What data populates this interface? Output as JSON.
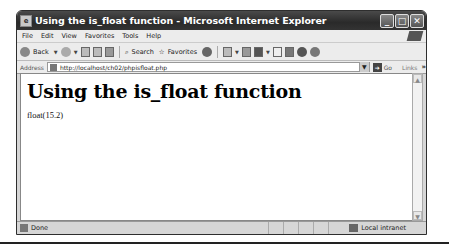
{
  "window": {
    "title": "Using the is_float function - Microsoft Internet Explorer",
    "controls": {
      "minimize": "_",
      "maximize": "□",
      "close": "✕"
    }
  },
  "menubar": {
    "items": [
      "File",
      "Edit",
      "View",
      "Favorites",
      "Tools",
      "Help"
    ]
  },
  "toolbar": {
    "back_label": "Back",
    "search_label": "Search",
    "favorites_label": "Favorites"
  },
  "addressbar": {
    "label": "Address",
    "url": "http://localhost/ch02/phpisfloat.php",
    "go_label": "Go",
    "links_label": "Links",
    "chevron": "»"
  },
  "page": {
    "heading": "Using the is_float function",
    "output": "float(15.2)"
  },
  "scrollbar": {
    "up": "▲",
    "down": "▼"
  },
  "statusbar": {
    "status": "Done",
    "zone": "Local intranet"
  }
}
